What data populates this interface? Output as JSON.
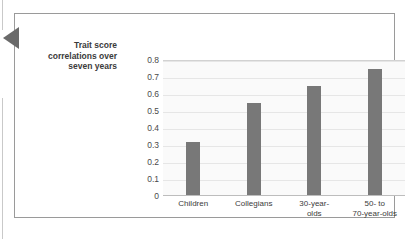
{
  "figure": {
    "axis_caption_lines": [
      "Trait score",
      "correlations over",
      "seven years"
    ],
    "pointer_icon": "left-triangle-pointer-icon"
  },
  "chart_data": {
    "type": "bar",
    "title": "",
    "subtitle": "",
    "xlabel": "",
    "ylabel": "Trait score correlations over seven years",
    "categories": [
      "Children",
      "Collegians",
      "30-year-olds",
      "50- to 70-year-olds"
    ],
    "category_label_lines": [
      [
        "Children"
      ],
      [
        "Collegians"
      ],
      [
        "30-year-",
        "olds"
      ],
      [
        "50- to",
        "70-year-olds"
      ]
    ],
    "values": [
      0.31,
      0.54,
      0.64,
      0.74
    ],
    "ylim": [
      0,
      0.8
    ],
    "ytick_labels": [
      "0.8",
      "0.7",
      "0.6",
      "0.5",
      "0.4",
      "0.3",
      "0.2",
      "0.1",
      "0"
    ],
    "ytick_values": [
      0.8,
      0.7,
      0.6,
      0.5,
      0.4,
      0.3,
      0.2,
      0.1,
      0
    ],
    "grid": true,
    "grid_axis": "y",
    "legend": false,
    "legend_position": "none",
    "bar_color": "#787878",
    "plot_background": "#fafafa",
    "gridline_color": "#e6e6e6",
    "panel_border_color": "#9a9a9a",
    "pointer_color": "#6a6a6a"
  }
}
